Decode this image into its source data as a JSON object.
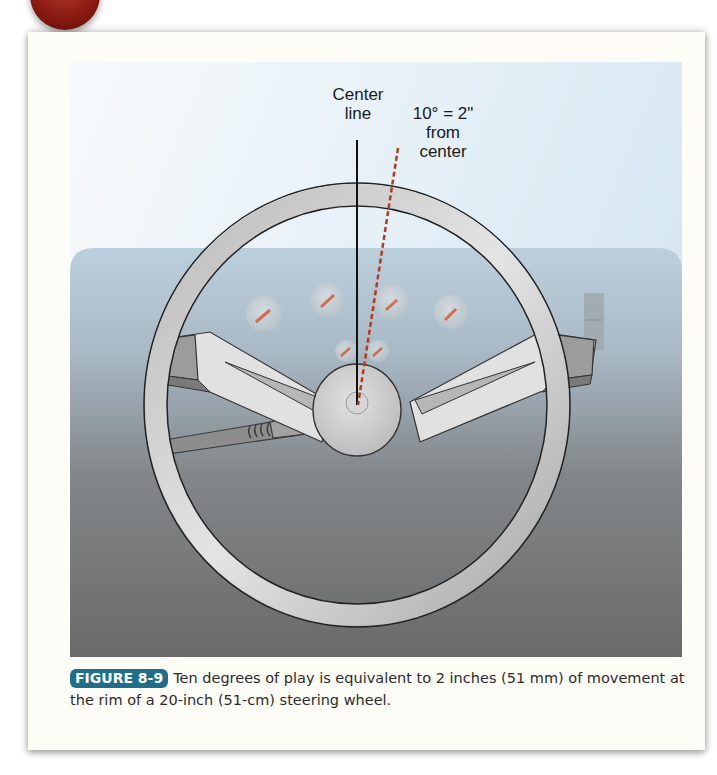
{
  "figure": {
    "number_label": "FIGURE 8-9",
    "caption": "Ten degrees of play is equivalent to 2 inches (51 mm) of movement at the rim of a 20-inch (51-cm) steering wheel.",
    "annotations": {
      "center_line": {
        "line1": "Center",
        "line2": "line"
      },
      "play_label": {
        "line1": "10° = 2\"",
        "line2": "from",
        "line3": "center"
      }
    },
    "illustration": {
      "subject": "steering wheel with dashboard gauges",
      "colors": {
        "center_line": "#111111",
        "play_line": "#b33a24",
        "badge": "#216e8a",
        "dashboard_top": "#b8ccd9",
        "dashboard_bottom": "#6b6b6b",
        "sky_top": "#f4f8fb",
        "sky_bottom": "#d8e8f2"
      }
    }
  }
}
